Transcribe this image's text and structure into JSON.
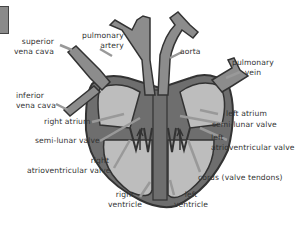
{
  "diagram": {
    "colors": {
      "outline": "#3a3a3a",
      "heart_wall": "#6e6e6e",
      "chamber": "#bdbdbd",
      "vessel_fill": "#8c8c8c",
      "vessel_inner": "#c8c8c8",
      "pointer": "#e0e0e0",
      "label_text": "#333333"
    },
    "labels": {
      "superior_vena_cava": [
        "superior",
        "vena cava"
      ],
      "pulmonary_artery": [
        "pulmonary",
        "artery"
      ],
      "aorta": [
        "aorta"
      ],
      "pulmonary_vein": [
        "pulmonary",
        "vein"
      ],
      "inferior_vena_cava": [
        "inferior",
        "vena cava"
      ],
      "left_atrium": [
        "left atrium"
      ],
      "right_atrium": [
        "right atrium"
      ],
      "semi_lunar_valve_left": [
        "semi-lunar valve"
      ],
      "semi_lunar_valve_right": [
        "semi-lunar valve"
      ],
      "left_av_valve": [
        "left",
        "atrioventricular valve"
      ],
      "right_av_valve": [
        "right",
        "atrioventricular valve"
      ],
      "cords": [
        "cords (valve tendons)"
      ],
      "right_ventricle": [
        "right",
        "ventricle"
      ],
      "left_ventricle": [
        "left",
        "ventricle"
      ]
    }
  }
}
